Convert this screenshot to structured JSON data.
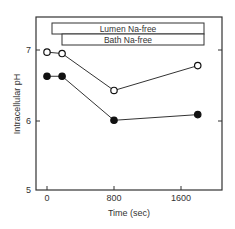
{
  "chart_data": {
    "type": "line",
    "title": "",
    "xlabel": "Time (sec)",
    "ylabel": "Intracellular pH",
    "xlim": [
      -130,
      2080
    ],
    "ylim": [
      5,
      7.47
    ],
    "xticks": [
      0,
      800,
      1600
    ],
    "xtick_labels": [
      "0",
      "800",
      "1600"
    ],
    "yticks": [
      5,
      6,
      7
    ],
    "ytick_labels": [
      "5",
      "6",
      "7"
    ],
    "grid": false,
    "annotations": [
      {
        "label": "Lumen Na-free",
        "x_start": 100,
        "x_end": 2080
      },
      {
        "label": "Bath   Na-free",
        "x_start": 180,
        "x_end": 2080
      }
    ],
    "series": [
      {
        "name": "open circles",
        "marker": "open-circle",
        "x": [
          0,
          180,
          800,
          1800
        ],
        "values": [
          6.97,
          6.95,
          6.43,
          6.78
        ]
      },
      {
        "name": "filled circles",
        "marker": "filled-circle",
        "x": [
          0,
          180,
          800,
          1800
        ],
        "values": [
          6.63,
          6.63,
          6.01,
          6.09
        ]
      }
    ]
  },
  "colors": {
    "ink": "#333333",
    "background": "#ffffff"
  }
}
